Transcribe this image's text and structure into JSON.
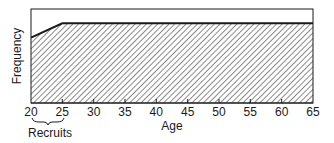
{
  "chart_data": {
    "type": "area",
    "title": "",
    "xlabel": "Age",
    "ylabel": "Frequency",
    "x": [
      20,
      25,
      30,
      35,
      40,
      45,
      50,
      55,
      60,
      65
    ],
    "values": [
      0.82,
      1.0,
      1.0,
      1.0,
      1.0,
      1.0,
      1.0,
      1.0,
      1.0,
      1.0
    ],
    "xlim": [
      20,
      65
    ],
    "ylim": [
      0,
      1.18
    ],
    "ytick_labels": [],
    "grid": false,
    "fill_pattern": "diagonal-hatch",
    "annotations": [
      {
        "text": "Recruits",
        "type": "brace",
        "x_from": 20,
        "x_to": 25
      }
    ],
    "series": [
      {
        "name": "Age distribution",
        "points": [
          [
            20,
            0.82
          ],
          [
            25,
            1.0
          ],
          [
            65,
            1.0
          ]
        ]
      }
    ]
  },
  "labels": {
    "xlabel": "Age",
    "ylabel": "Frequency",
    "recruits": "Recruits",
    "ticks": [
      "20",
      "25",
      "30",
      "35",
      "40",
      "45",
      "50",
      "55",
      "60",
      "65"
    ]
  },
  "colors": {
    "line": "#1a1a1a",
    "hatch": "#2a2a2a",
    "background": "#ffffff"
  }
}
